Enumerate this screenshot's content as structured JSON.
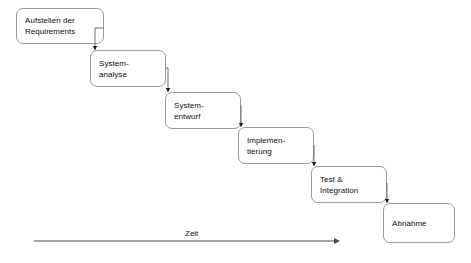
{
  "diagram": {
    "phases": [
      {
        "id": "requirements",
        "label": "Aufstellen der\nRequirements",
        "x": 16,
        "y": 8,
        "w": 88,
        "h": 36
      },
      {
        "id": "systemanalyse",
        "label": "System-\nanalyse",
        "x": 90,
        "y": 50,
        "w": 76,
        "h": 37
      },
      {
        "id": "systementwurf",
        "label": "System-\nentwurf",
        "x": 165,
        "y": 92,
        "w": 76,
        "h": 37
      },
      {
        "id": "implementierung",
        "label": "Implemen-\ntierung",
        "x": 238,
        "y": 127,
        "w": 76,
        "h": 37
      },
      {
        "id": "test",
        "label": "Test &\nIntegration",
        "x": 311,
        "y": 166,
        "w": 76,
        "h": 37
      },
      {
        "id": "abnahme",
        "label": "Abnahme",
        "x": 383,
        "y": 203,
        "w": 72,
        "h": 40
      }
    ],
    "connectors": [
      {
        "id": "requirements-to-systemanalyse",
        "from": "requirements",
        "to": "systemanalyse",
        "x1": 95,
        "y1": 28,
        "x2": 95,
        "y2": 50
      },
      {
        "id": "systemanalyse-to-systementwurf",
        "from": "systemanalyse",
        "to": "systementwurf",
        "x1": 168,
        "y1": 68,
        "x2": 168,
        "y2": 92
      },
      {
        "id": "systementwurf-to-implementierung",
        "from": "systementwurf",
        "to": "implementierung",
        "x1": 241,
        "y1": 106,
        "x2": 241,
        "y2": 127
      },
      {
        "id": "implementierung-to-test",
        "from": "implementierung",
        "to": "test",
        "x1": 314,
        "y1": 145,
        "x2": 314,
        "y2": 166
      },
      {
        "id": "test-to-abnahme",
        "from": "test",
        "to": "abnahme",
        "x1": 387,
        "y1": 183,
        "x2": 387,
        "y2": 203
      }
    ],
    "axis": {
      "label": "Zeit",
      "label_x": 185,
      "label_y": 229,
      "start_x": 34,
      "end_x": 340,
      "y": 241
    }
  }
}
